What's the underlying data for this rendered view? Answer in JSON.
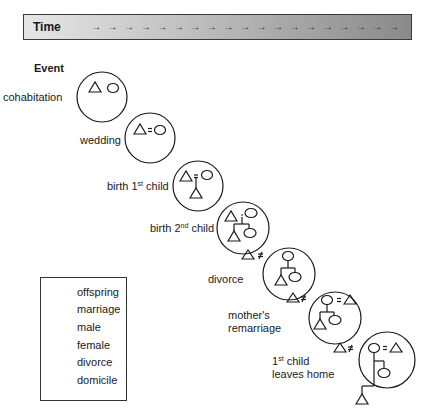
{
  "timeline": {
    "label": "Time",
    "arrow_glyph": "→",
    "arrow_count": 19
  },
  "event_header": "Event",
  "events": [
    {
      "id": "cohabitation",
      "label": "cohabitation"
    },
    {
      "id": "wedding",
      "label": "wedding"
    },
    {
      "id": "birth1",
      "label_pre": "birth 1",
      "label_sup": "st",
      "label_post": " child"
    },
    {
      "id": "birth2",
      "label_pre": "birth 2",
      "label_sup": "nd",
      "label_post": " child"
    },
    {
      "id": "divorce",
      "label": "divorce"
    },
    {
      "id": "remarriage",
      "label_line1": "mother's",
      "label_line2": "remarriage"
    },
    {
      "id": "leaves_home",
      "label_line1_pre": "1",
      "label_line1_sup": "st",
      "label_line1_post": " child",
      "label_line2": "leaves home"
    }
  ],
  "legend": {
    "items": [
      {
        "symbol": "offspring-line",
        "label": "offspring"
      },
      {
        "symbol": "equals",
        "label": "marriage"
      },
      {
        "symbol": "triangle",
        "label": "male"
      },
      {
        "symbol": "ellipse",
        "label": "female"
      },
      {
        "symbol": "not-equal",
        "label": "divorce"
      },
      {
        "symbol": "circle",
        "label": "domicile"
      }
    ]
  },
  "symbols": {
    "marriage": "=",
    "divorce": "≠"
  },
  "colors": {
    "stroke": "#1a1a1a",
    "bar_light": "#e6e6e6",
    "bar_dark": "#8a8a8a"
  }
}
